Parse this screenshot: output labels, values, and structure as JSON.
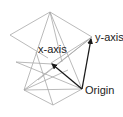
{
  "diagram": {
    "labels": {
      "x_axis": "x-axis",
      "y_axis": "y-axis",
      "origin": "Origin"
    },
    "colors": {
      "wire": "#a8a8a8",
      "axis": "#1a1a1a",
      "text": "#222222"
    }
  }
}
